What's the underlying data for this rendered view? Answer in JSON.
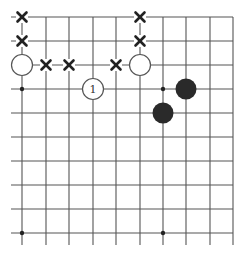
{
  "diagram": {
    "type": "go-board-fragment",
    "colors": {
      "background": "#ffffff",
      "grid_line": "#555555",
      "black_stone": "#2a2a2a",
      "white_stone_fill": "#ffffff",
      "white_stone_stroke": "#555555",
      "mark": "#222222"
    },
    "grid": {
      "columns_x": [
        22,
        46,
        69,
        93,
        116,
        140,
        163,
        186,
        210,
        233
      ],
      "rows_y": [
        17,
        41,
        65,
        89,
        113,
        137,
        161,
        185,
        209,
        233
      ],
      "left_stub_x": 11,
      "bottom_stub_y": 245,
      "top_edge": true,
      "right_edge": true
    },
    "star_points": [
      {
        "col": 0,
        "row": 3
      },
      {
        "col": 6,
        "row": 3
      },
      {
        "col": 0,
        "row": 9
      },
      {
        "col": 6,
        "row": 9
      }
    ],
    "white_stones": [
      {
        "col": 0,
        "row": 2,
        "label": ""
      },
      {
        "col": 5,
        "row": 2,
        "label": ""
      },
      {
        "col": 3,
        "row": 3,
        "label": "1"
      }
    ],
    "black_stones": [
      {
        "col": 7,
        "row": 3
      },
      {
        "col": 6,
        "row": 4
      }
    ],
    "x_marks": [
      {
        "col": 0,
        "row": 0
      },
      {
        "col": 0,
        "row": 1
      },
      {
        "col": 1,
        "row": 2
      },
      {
        "col": 2,
        "row": 2
      },
      {
        "col": 4,
        "row": 2
      },
      {
        "col": 5,
        "row": 0
      },
      {
        "col": 5,
        "row": 1
      }
    ]
  }
}
